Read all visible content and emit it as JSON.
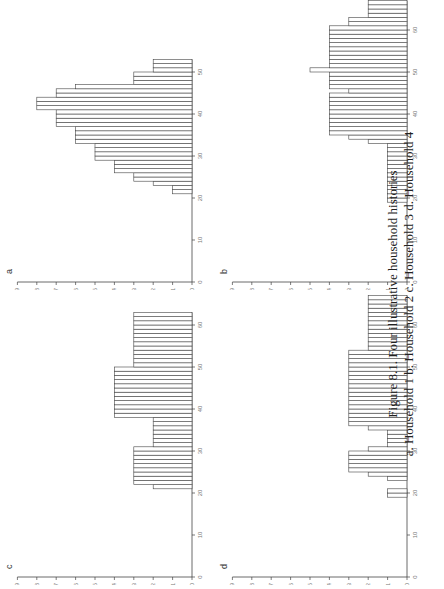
{
  "caption": {
    "title": "Figure 8.1.  Four illustrative household histories",
    "subtitle": "a. Household 1   b. Household 2   c. Household 3   d. Household 4"
  },
  "chart_data": [
    {
      "type": "bar",
      "panel": "a",
      "title": "Household 1",
      "xlabel": "",
      "ylabel": "",
      "xlim": [
        0,
        52
      ],
      "ylim": [
        0,
        9
      ],
      "x_ticks": [
        0,
        10,
        20,
        30,
        40,
        50
      ],
      "y_ticks": [
        0,
        1,
        2,
        3,
        4,
        5,
        6,
        7,
        8,
        9
      ],
      "x": [
        21,
        22,
        23,
        24,
        25,
        26,
        27,
        28,
        29,
        30,
        31,
        32,
        33,
        34,
        35,
        36,
        37,
        38,
        39,
        40,
        41,
        42,
        43,
        44,
        45,
        46,
        47,
        48,
        49,
        50,
        51,
        52
      ],
      "values": [
        1,
        1,
        2,
        3,
        3,
        4,
        4,
        4,
        5,
        5,
        5,
        5,
        6,
        6,
        6,
        6,
        7,
        7,
        7,
        7,
        8,
        8,
        8,
        7,
        7,
        6,
        3,
        3,
        3,
        2,
        2,
        2
      ]
    },
    {
      "type": "bar",
      "panel": "b",
      "title": "Household 2",
      "xlabel": "",
      "ylabel": "",
      "xlim": [
        0,
        66
      ],
      "ylim": [
        0,
        9
      ],
      "x_ticks": [
        0,
        10,
        20,
        30,
        40,
        50,
        60
      ],
      "y_ticks": [
        0,
        1,
        2,
        3,
        4,
        5,
        6,
        7,
        8,
        9
      ],
      "x": [
        19,
        20,
        21,
        22,
        23,
        24,
        25,
        26,
        27,
        28,
        29,
        30,
        31,
        32,
        33,
        34,
        35,
        36,
        37,
        38,
        39,
        40,
        41,
        42,
        43,
        44,
        45,
        46,
        47,
        48,
        49,
        50,
        51,
        52,
        53,
        54,
        55,
        56,
        57,
        58,
        59,
        60,
        61,
        62,
        63,
        64,
        65,
        66
      ],
      "values": [
        1,
        1,
        1,
        1,
        1,
        1,
        1,
        1,
        1,
        1,
        1,
        1,
        1,
        1,
        2,
        3,
        4,
        4,
        4,
        4,
        4,
        4,
        4,
        4,
        4,
        4,
        3,
        4,
        4,
        4,
        4,
        5,
        4,
        4,
        4,
        4,
        4,
        4,
        4,
        4,
        4,
        4,
        3,
        3,
        2,
        2,
        2,
        2
      ]
    },
    {
      "type": "bar",
      "panel": "c",
      "title": "Household 3",
      "xlabel": "",
      "ylabel": "",
      "xlim": [
        0,
        62
      ],
      "ylim": [
        0,
        9
      ],
      "x_ticks": [
        0,
        10,
        20,
        30,
        40,
        50,
        60
      ],
      "y_ticks": [
        0,
        1,
        2,
        3,
        4,
        5,
        6,
        7,
        8,
        9
      ],
      "x": [
        21,
        22,
        23,
        24,
        25,
        26,
        27,
        28,
        29,
        30,
        31,
        32,
        33,
        34,
        35,
        36,
        37,
        38,
        39,
        40,
        41,
        42,
        43,
        44,
        45,
        46,
        47,
        48,
        49,
        50,
        51,
        52,
        53,
        54,
        55,
        56,
        57,
        58,
        59,
        60,
        61,
        62
      ],
      "values": [
        2,
        3,
        3,
        3,
        3,
        3,
        3,
        3,
        3,
        3,
        2,
        2,
        2,
        2,
        2,
        2,
        2,
        4,
        4,
        4,
        4,
        4,
        4,
        4,
        4,
        4,
        4,
        4,
        4,
        3,
        3,
        3,
        3,
        3,
        3,
        3,
        3,
        3,
        3,
        3,
        3,
        3
      ]
    },
    {
      "type": "bar",
      "panel": "d",
      "title": "Household 4",
      "xlabel": "",
      "ylabel": "",
      "xlim": [
        0,
        66
      ],
      "ylim": [
        0,
        9
      ],
      "x_ticks": [
        0,
        10,
        20,
        30,
        40,
        50,
        60
      ],
      "y_ticks": [
        0,
        1,
        2,
        3,
        4,
        5,
        6,
        7,
        8,
        9
      ],
      "x": [
        19,
        20,
        23,
        24,
        25,
        26,
        27,
        28,
        29,
        30,
        31,
        32,
        33,
        34,
        35,
        36,
        37,
        38,
        39,
        40,
        41,
        42,
        43,
        44,
        45,
        46,
        47,
        48,
        49,
        50,
        51,
        52,
        53,
        54,
        55,
        56,
        57,
        58,
        59,
        60,
        61,
        62,
        63,
        64,
        65,
        66
      ],
      "values": [
        1,
        1,
        1,
        2,
        3,
        3,
        3,
        3,
        3,
        2,
        1,
        1,
        1,
        1,
        2,
        3,
        3,
        3,
        3,
        3,
        3,
        3,
        3,
        3,
        3,
        3,
        3,
        3,
        3,
        3,
        3,
        3,
        3,
        2,
        2,
        2,
        2,
        2,
        2,
        2,
        2,
        2,
        2,
        2,
        2,
        2
      ]
    }
  ]
}
